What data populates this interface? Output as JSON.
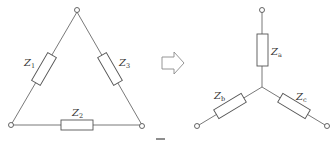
{
  "figure": {
    "delta": {
      "labels": [
        {
          "main": "Z",
          "sub": "1"
        },
        {
          "main": "Z",
          "sub": "2"
        },
        {
          "main": "Z",
          "sub": "3"
        }
      ]
    },
    "transform_arrow": "right-arrow-outline",
    "star": {
      "labels": [
        {
          "main": "Z",
          "sub": "a"
        },
        {
          "main": "Z",
          "sub": "b"
        },
        {
          "main": "Z",
          "sub": "c"
        }
      ]
    },
    "colors": {
      "line": "#6a6a6a",
      "resistor": "#555555",
      "arrow": "#8a8a8a",
      "text": "#333333",
      "background": "#ffffff"
    }
  }
}
